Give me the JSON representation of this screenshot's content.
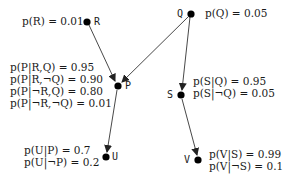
{
  "nodes": {
    "R": {
      "name": "R",
      "x": 87,
      "y": 22
    },
    "Q": {
      "name": "Q",
      "x": 191,
      "y": 14
    },
    "P": {
      "name": "P",
      "x": 118,
      "y": 86
    },
    "S": {
      "name": "S",
      "x": 181,
      "y": 95
    },
    "U": {
      "name": "U",
      "x": 106,
      "y": 157
    },
    "V": {
      "name": "V",
      "x": 198,
      "y": 160
    }
  },
  "edges": [
    {
      "from": "R",
      "to": "P"
    },
    {
      "from": "Q",
      "to": "P"
    },
    {
      "from": "Q",
      "to": "S"
    },
    {
      "from": "P",
      "to": "U"
    },
    {
      "from": "S",
      "to": "V"
    }
  ],
  "probabilities": {
    "R": [
      "p(R) = 0.01"
    ],
    "Q": [
      "p(Q) = 0.05"
    ],
    "P": [
      "p(P|R,Q) = 0.95",
      "p(P|R,¬Q) = 0.90",
      "p(P|¬R,Q) = 0.80",
      "p(P|¬R,¬Q) = 0.01"
    ],
    "S": [
      "p(S|Q) = 0.95",
      "p(S|¬Q) = 0.05"
    ],
    "U": [
      "p(U|P) = 0.7",
      "p(U|¬P) = 0.2"
    ],
    "V": [
      "p(V|S) = 0.99",
      "p(V|¬S) = 0.1"
    ]
  },
  "colors": {
    "node": "#000000",
    "edge": "#333333",
    "text": "#1a1a1a",
    "background": "#ffffff"
  }
}
